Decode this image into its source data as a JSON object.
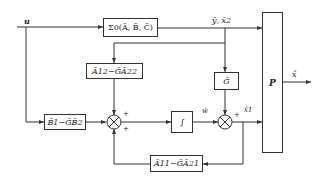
{
  "diagram": {
    "type": "block-diagram",
    "input_label": "u",
    "output_label": "x̂",
    "blocks": {
      "plant": {
        "label": "Σ0(Ā, B̄, C̄)"
      },
      "a12_gain": {
        "label": "Ā12−ḠĀ22"
      },
      "g_gain": {
        "label": "Ḡ"
      },
      "b_gain": {
        "label": "B̄1−ḠB̄2"
      },
      "integrator": {
        "label": "∫"
      },
      "a11_gain": {
        "label": "Ā11−ḠĀ21"
      },
      "p_transform": {
        "label": "P"
      }
    },
    "signals": {
      "plant_output": "ȳ, x̄2",
      "w_hat": "ŵ",
      "x1_hat": "x̂1"
    },
    "summers": {
      "sum1": {
        "signs": [
          "+",
          "+"
        ]
      },
      "sum2": {
        "signs": [
          "+"
        ]
      }
    },
    "colors": {
      "line": "#333333",
      "text": "#222222",
      "background": "#ffffff"
    }
  }
}
